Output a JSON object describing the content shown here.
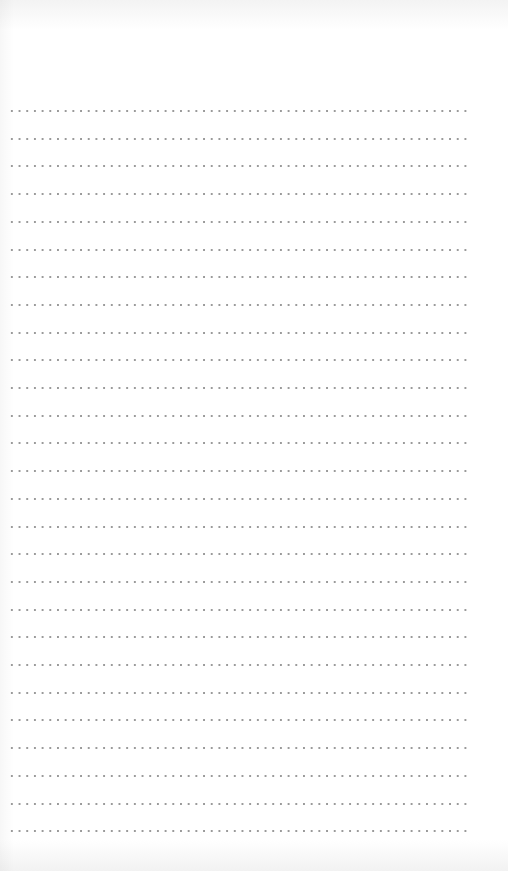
{
  "page": {
    "type": "dotted-ruled-sheet",
    "background_color": "#ffffff",
    "dot_color": "#9a9a9a",
    "line_count": 27,
    "first_line_y": 110,
    "line_spacing": 27.7,
    "line_left_x": 8,
    "line_right_x": 469,
    "dot_spacing": 7.7
  }
}
